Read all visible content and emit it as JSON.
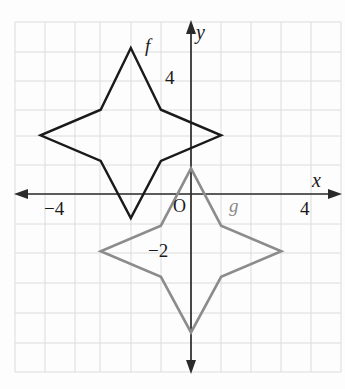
{
  "figure": {
    "kind": "coordinate-grid-graph",
    "width": 345,
    "height": 389,
    "background_color": "#fdfdfd",
    "grid_color": "#dcdcdc",
    "axis_color": "#2b2b2b"
  },
  "axes": {
    "x_axis_label": "x",
    "y_axis_label": "y",
    "origin_label": "O",
    "x_ticks": [
      {
        "label": "−4",
        "value": -4
      },
      {
        "label": "4",
        "value": 4
      }
    ],
    "y_ticks": [
      {
        "label": "4",
        "value": 4
      },
      {
        "label": "−2",
        "value": -2
      }
    ],
    "xlim": [
      -5.8,
      5.0
    ],
    "ylim": [
      -5.7,
      5.9
    ],
    "grid": true,
    "grid_step": 1
  },
  "chart_data": {
    "type": "line",
    "title": "",
    "xlabel": "x",
    "ylabel": "y",
    "xlim": [
      -5.8,
      5.0
    ],
    "ylim": [
      -5.7,
      5.9
    ],
    "grid": true,
    "legend": "inline-curve-labels",
    "series": [
      {
        "name": "f",
        "label": "f",
        "color": "#1a1a1a",
        "closed": true,
        "label_position": {
          "x": -1.2,
          "y": 4.8
        },
        "points": [
          {
            "x": -2.0,
            "y": 4.85
          },
          {
            "x": -1.0,
            "y": 2.8
          },
          {
            "x": 1.0,
            "y": 1.95
          },
          {
            "x": -1.0,
            "y": 1.1
          },
          {
            "x": -2.0,
            "y": -0.8
          },
          {
            "x": -3.0,
            "y": 1.1
          },
          {
            "x": -5.0,
            "y": 1.95
          },
          {
            "x": -3.0,
            "y": 2.8
          }
        ]
      },
      {
        "name": "g",
        "label": "g",
        "color": "#8c8c8c",
        "closed": true,
        "label_position": {
          "x": 1.3,
          "y": -0.55
        },
        "points": [
          {
            "x": 0.0,
            "y": 0.85
          },
          {
            "x": 1.0,
            "y": -1.05
          },
          {
            "x": 3.0,
            "y": -1.9
          },
          {
            "x": 1.0,
            "y": -2.75
          },
          {
            "x": 0.0,
            "y": -4.6
          },
          {
            "x": -1.0,
            "y": -2.75
          },
          {
            "x": -3.0,
            "y": -1.9
          },
          {
            "x": -1.0,
            "y": -1.05
          }
        ]
      }
    ]
  },
  "labels": {
    "f_curve": "f",
    "g_curve": "g",
    "origin": "O",
    "x_axis": "x",
    "y_axis": "y",
    "x_tick_neg4": "−4",
    "x_tick_4": "4",
    "y_tick_4": "4",
    "y_tick_neg2": "−2"
  }
}
